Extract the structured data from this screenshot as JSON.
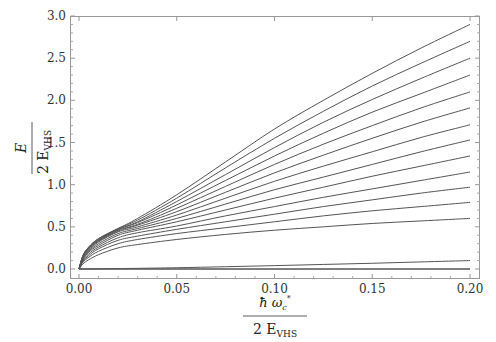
{
  "chart_data": {
    "type": "line",
    "title": "",
    "xlabel": "ħ ω_c* / 2 E_VHS",
    "ylabel": "E / 2 E_VHS",
    "xlabel_parts": {
      "num_main": "ħ ω",
      "num_sub": "c",
      "num_sup": "*",
      "den": "2 E",
      "den_sub": "VHS"
    },
    "ylabel_parts": {
      "num": "E",
      "den": "2 E",
      "den_sub": "VHS"
    },
    "xlim": [
      0.0,
      0.2
    ],
    "ylim": [
      0.0,
      3.0
    ],
    "x_ticks": [
      "0.00",
      "0.05",
      "0.10",
      "0.15",
      "0.20"
    ],
    "y_ticks": [
      "0.0",
      "0.5",
      "1.0",
      "1.5",
      "2.0",
      "2.5",
      "3.0"
    ],
    "grid": false,
    "legend": null,
    "x": [
      0.0,
      0.002,
      0.005,
      0.01,
      0.02,
      0.03,
      0.05,
      0.075,
      0.1,
      0.125,
      0.15,
      0.175,
      0.2
    ],
    "series": [
      {
        "name": "level 14",
        "values": [
          0.0,
          0.16,
          0.26,
          0.36,
          0.48,
          0.6,
          0.88,
          1.27,
          1.66,
          2.0,
          2.32,
          2.62,
          2.9
        ]
      },
      {
        "name": "level 13",
        "values": [
          0.0,
          0.16,
          0.26,
          0.36,
          0.48,
          0.58,
          0.84,
          1.2,
          1.55,
          1.87,
          2.17,
          2.44,
          2.7
        ]
      },
      {
        "name": "level 12",
        "values": [
          0.0,
          0.15,
          0.25,
          0.35,
          0.47,
          0.56,
          0.8,
          1.12,
          1.44,
          1.74,
          2.01,
          2.26,
          2.5
        ]
      },
      {
        "name": "level 11",
        "values": [
          0.0,
          0.15,
          0.25,
          0.34,
          0.47,
          0.55,
          0.76,
          1.05,
          1.34,
          1.61,
          1.86,
          2.08,
          2.3
        ]
      },
      {
        "name": "level 10",
        "values": [
          0.0,
          0.14,
          0.24,
          0.34,
          0.46,
          0.53,
          0.72,
          0.98,
          1.24,
          1.48,
          1.7,
          1.91,
          2.1
        ]
      },
      {
        "name": "level 9",
        "values": [
          0.0,
          0.14,
          0.23,
          0.33,
          0.45,
          0.52,
          0.68,
          0.91,
          1.14,
          1.35,
          1.55,
          1.74,
          1.91
        ]
      },
      {
        "name": "level 8",
        "values": [
          0.0,
          0.13,
          0.22,
          0.32,
          0.44,
          0.5,
          0.64,
          0.84,
          1.04,
          1.22,
          1.39,
          1.56,
          1.71
        ]
      },
      {
        "name": "level 7",
        "values": [
          0.0,
          0.12,
          0.21,
          0.3,
          0.42,
          0.48,
          0.6,
          0.77,
          0.94,
          1.09,
          1.24,
          1.39,
          1.53
        ]
      },
      {
        "name": "level 6",
        "values": [
          0.0,
          0.11,
          0.2,
          0.28,
          0.4,
          0.46,
          0.56,
          0.7,
          0.84,
          0.97,
          1.1,
          1.22,
          1.34
        ]
      },
      {
        "name": "level 5",
        "values": [
          0.0,
          0.1,
          0.18,
          0.26,
          0.37,
          0.43,
          0.51,
          0.63,
          0.74,
          0.85,
          0.95,
          1.05,
          1.15
        ]
      },
      {
        "name": "level 4",
        "values": [
          0.0,
          0.09,
          0.16,
          0.24,
          0.34,
          0.39,
          0.47,
          0.56,
          0.65,
          0.74,
          0.82,
          0.9,
          0.97
        ]
      },
      {
        "name": "level 3",
        "values": [
          0.0,
          0.08,
          0.14,
          0.21,
          0.3,
          0.35,
          0.42,
          0.49,
          0.56,
          0.63,
          0.69,
          0.74,
          0.79
        ]
      },
      {
        "name": "level 2",
        "values": [
          0.0,
          0.06,
          0.11,
          0.17,
          0.25,
          0.29,
          0.35,
          0.41,
          0.46,
          0.5,
          0.54,
          0.57,
          0.6
        ]
      },
      {
        "name": "level 1",
        "values": [
          0.0,
          0.0,
          0.001,
          0.002,
          0.005,
          0.008,
          0.015,
          0.027,
          0.04,
          0.054,
          0.068,
          0.084,
          0.1
        ]
      },
      {
        "name": "level 0",
        "values": [
          0.0,
          0.0,
          0.0,
          0.0,
          0.0,
          0.0,
          0.0,
          0.0,
          0.0,
          0.0,
          0.0,
          0.0,
          0.0
        ]
      }
    ],
    "colors": {
      "line": "#555555",
      "frame": "#888888",
      "text": "#333333"
    }
  }
}
